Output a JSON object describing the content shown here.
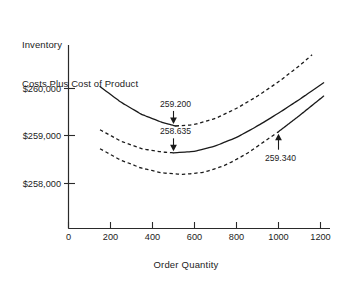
{
  "chart_data": {
    "type": "line",
    "title": "Inventory Costs Plus Cost of Product",
    "title_lines": [
      "Inventory",
      "Costs Plus Cost of Product"
    ],
    "xlabel": "Order  Quantity",
    "ylabel": "",
    "grid": false,
    "legend": null,
    "xlim": [
      0,
      1270
    ],
    "ylim": [
      257400,
      260900
    ],
    "xticks": [
      0,
      200,
      400,
      600,
      800,
      1000,
      1200
    ],
    "xtick_labels": [
      "0",
      "200",
      "400",
      "600",
      "800",
      "1000",
      "1200"
    ],
    "yticks": [
      258000,
      259000,
      260000
    ],
    "ytick_labels": [
      "$258,000",
      "$259,000",
      "$260,000"
    ],
    "series": [
      {
        "name": "upper-cost-curve",
        "minimum_label": "259.200",
        "minimum_x": 500,
        "minimum_y": 259200,
        "segments": [
          {
            "style": "solid",
            "x_from": 150,
            "x_to": 510
          },
          {
            "style": "dashed",
            "x_from": 510,
            "x_to": 1160
          }
        ],
        "points": [
          {
            "x": 150,
            "y": 260030
          },
          {
            "x": 250,
            "y": 259700
          },
          {
            "x": 350,
            "y": 259440
          },
          {
            "x": 450,
            "y": 259270
          },
          {
            "x": 510,
            "y": 259200
          },
          {
            "x": 600,
            "y": 259230
          },
          {
            "x": 700,
            "y": 259360
          },
          {
            "x": 800,
            "y": 259570
          },
          {
            "x": 900,
            "y": 259830
          },
          {
            "x": 1000,
            "y": 260130
          },
          {
            "x": 1100,
            "y": 260470
          },
          {
            "x": 1160,
            "y": 260700
          }
        ]
      },
      {
        "name": "middle-cost-curve",
        "minimum_label": "258.635",
        "minimum_x": 500,
        "minimum_y": 258635,
        "segments": [
          {
            "style": "dashed",
            "x_from": 150,
            "x_to": 500
          },
          {
            "style": "solid",
            "x_from": 500,
            "x_to": 1215
          }
        ],
        "points": [
          {
            "x": 150,
            "y": 259120
          },
          {
            "x": 250,
            "y": 258880
          },
          {
            "x": 350,
            "y": 258720
          },
          {
            "x": 450,
            "y": 258650
          },
          {
            "x": 500,
            "y": 258635
          },
          {
            "x": 600,
            "y": 258665
          },
          {
            "x": 700,
            "y": 258780
          },
          {
            "x": 800,
            "y": 258960
          },
          {
            "x": 900,
            "y": 259200
          },
          {
            "x": 1000,
            "y": 259470
          },
          {
            "x": 1100,
            "y": 259760
          },
          {
            "x": 1215,
            "y": 260110
          }
        ]
      },
      {
        "name": "lower-cost-curve",
        "minimum_label": "259.340",
        "annotation_x": 1000,
        "annotation_y": 259340,
        "segments": [
          {
            "style": "dashed",
            "x_from": 150,
            "x_to": 1000
          },
          {
            "style": "solid",
            "x_from": 1000,
            "x_to": 1215
          }
        ],
        "points": [
          {
            "x": 150,
            "y": 258720
          },
          {
            "x": 250,
            "y": 258480
          },
          {
            "x": 350,
            "y": 258310
          },
          {
            "x": 450,
            "y": 258210
          },
          {
            "x": 550,
            "y": 258180
          },
          {
            "x": 650,
            "y": 258230
          },
          {
            "x": 750,
            "y": 258380
          },
          {
            "x": 850,
            "y": 258620
          },
          {
            "x": 1000,
            "y": 259080
          },
          {
            "x": 1100,
            "y": 259420
          },
          {
            "x": 1215,
            "y": 259830
          }
        ]
      }
    ],
    "annotations": [
      {
        "label": "259.200",
        "target_series": "upper-cost-curve",
        "arrow": "down",
        "x": 500
      },
      {
        "label": "258.635",
        "target_series": "middle-cost-curve",
        "arrow": "down",
        "x": 500
      },
      {
        "label": "259.340",
        "target_series": "lower-cost-curve",
        "arrow": "up",
        "x": 1000
      }
    ]
  }
}
